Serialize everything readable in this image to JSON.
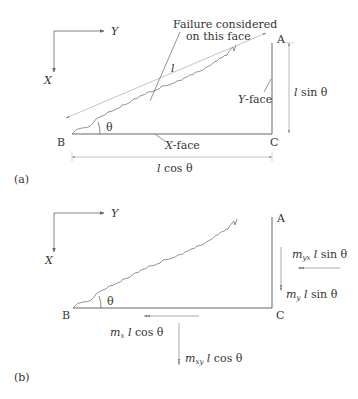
{
  "figure_a": {
    "panel_label": "(a)",
    "axes": {
      "x_label": "X",
      "y_label": "Y"
    },
    "vertices": {
      "a": "A",
      "b": "B",
      "c": "C"
    },
    "annotation_line1": "Failure considered",
    "annotation_line2": "on this face",
    "hyp_length_label": "l",
    "angle_label": "θ",
    "y_face_label_main": "Y",
    "y_face_label_suffix": "-face",
    "x_face_label_main": "X",
    "x_face_label_suffix": "-face",
    "height_dim": {
      "l": "l",
      "rest": " sin θ"
    },
    "width_dim": {
      "l": "l",
      "rest": " cos θ"
    }
  },
  "figure_b": {
    "panel_label": "(b)",
    "axes": {
      "x_label": "X",
      "y_label": "Y"
    },
    "vertices": {
      "a": "A",
      "b": "B",
      "c": "C"
    },
    "angle_label": "θ",
    "forces": {
      "myx": {
        "m": "m",
        "sub": "yx",
        "l": " l",
        "rest": " sin θ"
      },
      "my": {
        "m": "m",
        "sub": "y",
        "l": " l",
        "rest": " sin θ"
      },
      "mx": {
        "m": "m",
        "sub": "x",
        "l": " l",
        "rest": " cos θ"
      },
      "mxy": {
        "m": "m",
        "sub": "xy",
        "l": " l",
        "rest": " cos θ"
      }
    }
  },
  "colors": {
    "line": "#555555",
    "text": "#333333",
    "dim": "#999999"
  }
}
